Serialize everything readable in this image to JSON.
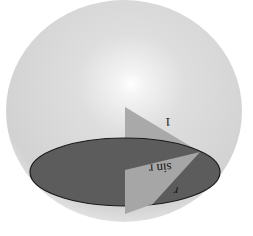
{
  "diagram": {
    "type": "sphere-cross-section",
    "labels": {
      "hypotenuse": "1",
      "opposite": "sin r",
      "angle": "r"
    },
    "orientation": "rotated 180 degrees",
    "colors": {
      "background": "#ffffff",
      "sphere_fill": "#d6d6d6",
      "sphere_highlight": "#ffffff",
      "disk_fill": "#5a5a5a",
      "disk_stroke": "#1a1a1a",
      "triangle_fill": "#a8a8a8",
      "triangle_lower_fill": "#9c9c9c"
    }
  }
}
